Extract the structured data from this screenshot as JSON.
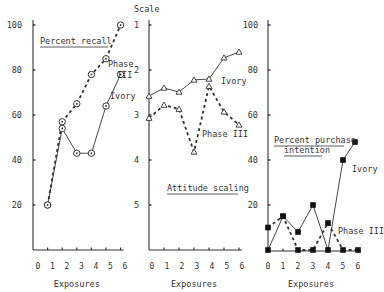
{
  "chart_data": [
    {
      "type": "line",
      "title": "Percent recall",
      "xlabel": "Exposures",
      "ylabel": "",
      "x_ticks": [
        "0",
        "1",
        "2",
        "3",
        "4",
        "5",
        "6"
      ],
      "y_ticks": [
        "100",
        "80",
        "60",
        "40",
        "20"
      ],
      "ylim": [
        0,
        100
      ],
      "grid": false,
      "series": [
        {
          "name": "Phase III",
          "style": "dashed",
          "marker": "circle-dot",
          "x": [
            1,
            2,
            3,
            4,
            5,
            6
          ],
          "values": [
            20,
            57,
            65,
            78,
            85,
            100
          ]
        },
        {
          "name": "Ivory",
          "style": "solid",
          "marker": "circle-dot",
          "x": [
            1,
            2,
            3,
            4,
            5,
            6
          ],
          "values": [
            20,
            54,
            43,
            43,
            64,
            78
          ]
        }
      ],
      "annotations": [
        "Phase III",
        "Ivory"
      ]
    },
    {
      "type": "line",
      "title": "Attitude scaling",
      "xlabel": "Exposures",
      "ylabel": "Scale",
      "x_ticks": [
        "0",
        "1",
        "2",
        "3",
        "4",
        "5",
        "6"
      ],
      "y_ticks": [
        "1",
        "2",
        "3",
        "4",
        "5"
      ],
      "ylim": [
        1,
        5
      ],
      "y_inverted": true,
      "grid": false,
      "series": [
        {
          "name": "Ivory",
          "style": "solid",
          "marker": "triangle",
          "x": [
            0,
            1,
            2,
            3,
            4,
            5,
            6
          ],
          "values": [
            2.58,
            2.4,
            2.49,
            2.22,
            2.2,
            1.73,
            1.6
          ]
        },
        {
          "name": "Phase III",
          "style": "dashed",
          "marker": "triangle",
          "x": [
            0,
            1,
            2,
            3,
            4,
            5,
            6
          ],
          "values": [
            3.07,
            2.78,
            2.87,
            3.82,
            2.36,
            2.93,
            3.22
          ]
        }
      ],
      "annotations": [
        "Ivory",
        "Phase III"
      ]
    },
    {
      "type": "line",
      "title": "Percent purchase intention",
      "xlabel": "Exposures",
      "ylabel": "",
      "x_ticks": [
        "0",
        "1",
        "2",
        "3",
        "4",
        "5",
        "6"
      ],
      "y_ticks": [
        "100",
        "80",
        "60",
        "40",
        "20"
      ],
      "ylim": [
        0,
        100
      ],
      "grid": false,
      "series": [
        {
          "name": "Ivory",
          "style": "solid",
          "marker": "square",
          "x": [
            0,
            1,
            2,
            3,
            4,
            5,
            5.8
          ],
          "values": [
            0,
            15,
            8,
            20,
            0,
            40,
            48
          ]
        },
        {
          "name": "Phase III",
          "style": "dashed",
          "marker": "square",
          "x": [
            0,
            1,
            2,
            3,
            4,
            5,
            6
          ],
          "values": [
            10,
            15,
            0,
            0,
            12,
            0,
            0
          ]
        }
      ],
      "annotations": [
        "Ivory",
        "Phase III"
      ]
    }
  ],
  "labels": {
    "recall_title": "Percent recall",
    "attitude_title": "Attitude scaling",
    "purchase_title_1": "Percent purchase",
    "purchase_title_2": "intention",
    "scale": "Scale",
    "exposures": "Exposures",
    "phase": "Phase",
    "phase_num": "III",
    "phase_full": "Phase III",
    "ivory": "Ivory"
  }
}
